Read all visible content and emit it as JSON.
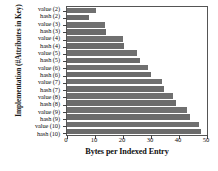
{
  "chart_data": {
    "type": "bar",
    "orientation": "horizontal",
    "title": "",
    "xlabel": "Bytes per Indexed Entry",
    "ylabel": "Implementation (#Attributes in Key)",
    "categories": [
      "value (2)",
      "hash  (2)",
      "value (3)",
      "hash  (3)",
      "value (4)",
      "hash  (4)",
      "value (5)",
      "hash  (5)",
      "value (6)",
      "hash  (6)",
      "value (7)",
      "hash  (7)",
      "value (8)",
      "hash  (8)",
      "value (9)",
      "hash  (9)",
      "value (10)",
      "hash  (10)"
    ],
    "values": [
      10.5,
      8.0,
      13.5,
      14.0,
      20.0,
      20.5,
      25.0,
      26.0,
      29.0,
      30.0,
      34.0,
      34.5,
      38.0,
      39.0,
      43.0,
      44.0,
      47.0,
      48.0
    ],
    "xlim": [
      0,
      50
    ],
    "xticks": [
      0,
      10,
      20,
      30,
      40,
      50
    ],
    "xtick_labels": [
      "0",
      "10",
      "20",
      "30",
      "40",
      "50"
    ],
    "grid": false,
    "legend": null,
    "bar_color": "#707070"
  }
}
